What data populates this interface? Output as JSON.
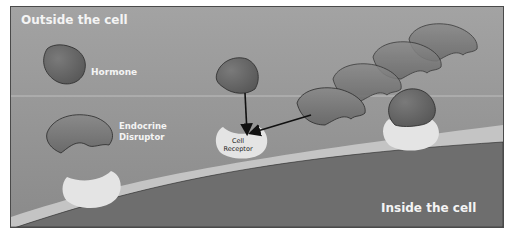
{
  "diagram": {
    "labels": {
      "outside": "Outside the cell",
      "inside": "Inside the cell",
      "hormone": "Hormone",
      "endocrine_line1": "Endocrine",
      "endocrine_line2": "Disruptor",
      "receptor_line1": "Cell",
      "receptor_line2": "Receptor"
    },
    "elements": {
      "hormones": [
        "hormone-left",
        "hormone-center",
        "hormone-bound-right"
      ],
      "disruptors": [
        "disruptor-left",
        "disruptor-sequence-1",
        "disruptor-sequence-2",
        "disruptor-sequence-3",
        "disruptor-sequence-4"
      ],
      "receptors": [
        "receptor-left",
        "receptor-center",
        "receptor-right"
      ],
      "arrows": [
        "arrow-hormone-to-receptor",
        "arrow-disruptor-to-receptor"
      ]
    },
    "colors": {
      "outside_bg": "#9c9c9c",
      "membrane": "#c4c4c4",
      "inside_bg": "#6e6e6e",
      "receptor": "#e4e4e4",
      "shape_fill": "#6a6a6a",
      "outline": "#2a2a2a",
      "text_light": "#f4f4f4"
    }
  }
}
